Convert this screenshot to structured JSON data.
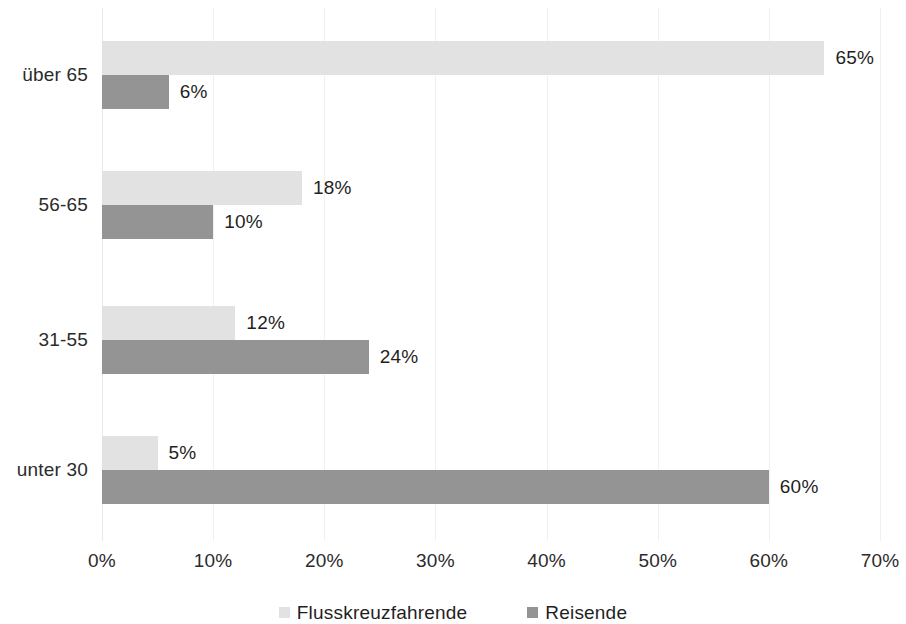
{
  "chart_data": {
    "type": "bar",
    "orientation": "horizontal",
    "title": "",
    "subtitle": "",
    "xlabel": "",
    "ylabel": "",
    "xlim": [
      0,
      70
    ],
    "xtick_labels": [
      "0%",
      "10%",
      "20%",
      "30%",
      "40%",
      "50%",
      "60%",
      "70%"
    ],
    "xtick_values": [
      0,
      10,
      20,
      30,
      40,
      50,
      60,
      70
    ],
    "grid": true,
    "grid_axis": "x",
    "legend_position": "bottom-center",
    "categories": [
      "über 65",
      "56-65",
      "31-55",
      "unter 30"
    ],
    "series": [
      {
        "name": "Flusskreuzfahrende",
        "color": "#e2e2e2",
        "values": [
          65,
          18,
          12,
          5
        ],
        "value_labels": [
          "65%",
          "18%",
          "12%",
          "5%"
        ]
      },
      {
        "name": "Reisende",
        "color": "#949494",
        "values": [
          6,
          10,
          24,
          60
        ],
        "value_labels": [
          "6%",
          "10%",
          "24%",
          "60%"
        ]
      }
    ]
  },
  "axis": {
    "ticks": [
      {
        "label": "0%",
        "value": 0
      },
      {
        "label": "10%",
        "value": 10
      },
      {
        "label": "20%",
        "value": 20
      },
      {
        "label": "30%",
        "value": 30
      },
      {
        "label": "40%",
        "value": 40
      },
      {
        "label": "50%",
        "value": 50
      },
      {
        "label": "60%",
        "value": 60
      },
      {
        "label": "70%",
        "value": 70
      }
    ]
  },
  "categories": [
    {
      "label": "über 65",
      "light_value": 65,
      "light_label": "65%",
      "dark_value": 6,
      "dark_label": "6%"
    },
    {
      "label": "56-65",
      "light_value": 18,
      "light_label": "18%",
      "dark_value": 10,
      "dark_label": "10%"
    },
    {
      "label": "31-55",
      "light_value": 12,
      "light_label": "12%",
      "dark_value": 24,
      "dark_label": "24%"
    },
    {
      "label": "unter 30",
      "light_value": 5,
      "light_label": "5%",
      "dark_value": 60,
      "dark_label": "60%"
    }
  ],
  "legend": {
    "items": [
      {
        "label": "Flusskreuzfahrende",
        "color": "#e2e2e2",
        "swatch": "light"
      },
      {
        "label": "Reisende",
        "color": "#949494",
        "swatch": "dark"
      }
    ]
  }
}
